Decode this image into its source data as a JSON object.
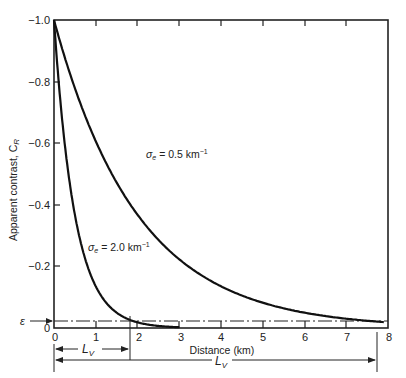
{
  "chart_data": {
    "type": "line",
    "title": "",
    "xlabel": "Distance (km)",
    "ylabel": "Apparent contrast, C_R",
    "xlim": [
      0,
      8
    ],
    "ylim": [
      0,
      -1.0
    ],
    "x_ticks": [
      "0",
      "1",
      "2",
      "3",
      "4",
      "5",
      "6",
      "7",
      "8"
    ],
    "y_ticks": [
      "0",
      "-0.2",
      "-0.4",
      "-0.6",
      "-0.8",
      "-1.0"
    ],
    "grid": false,
    "series": [
      {
        "name": "σe = 0.5 km⁻¹",
        "sigma": 0.5,
        "x": [
          0,
          0.5,
          1,
          1.5,
          2,
          2.5,
          3,
          3.5,
          4,
          4.5,
          5,
          5.5,
          6,
          6.5,
          7,
          7.5,
          7.8,
          8
        ],
        "values": [
          -1.0,
          -0.78,
          -0.61,
          -0.47,
          -0.37,
          -0.29,
          -0.22,
          -0.17,
          -0.14,
          -0.11,
          -0.08,
          -0.06,
          -0.05,
          -0.04,
          -0.03,
          -0.02,
          -0.02,
          -0.02
        ]
      },
      {
        "name": "σe = 2.0 km⁻¹",
        "sigma": 2.0,
        "x": [
          0,
          0.25,
          0.5,
          0.75,
          1,
          1.25,
          1.5,
          1.75,
          1.95,
          2.25,
          2.5,
          2.75,
          3
        ],
        "values": [
          -1.0,
          -0.61,
          -0.37,
          -0.22,
          -0.14,
          -0.08,
          -0.05,
          -0.03,
          -0.02,
          -0.01,
          -0.007,
          -0.004,
          0
        ]
      }
    ],
    "annotations": {
      "epsilon_label": "ε",
      "epsilon_value": -0.02,
      "short_lv_label": "L",
      "short_lv_sub": "V",
      "short_lv_km": 1.85,
      "long_lv_label": "L",
      "long_lv_sub": "V",
      "long_lv_km": 7.8,
      "label_sigma_05": "σe = 0.5 km⁻¹",
      "label_sigma_20": "σe = 2.0 km⁻¹",
      "y_zero_outer": "0"
    }
  },
  "labels": {
    "sigma_symbol": "σ",
    "sigma_sub": "e",
    "label_05_value": " = 0.5 km",
    "label_20_value": " = 2.0 km",
    "exp": "−1",
    "ylabel_text": "Apparent contrast, C",
    "ylabel_sub": "R",
    "xlabel": "Distance (km)",
    "epsilon": "ε",
    "zero_outer": "0",
    "lv_L": "L",
    "lv_V": "V",
    "x_ticks": [
      "0",
      "1",
      "2",
      "3",
      "4",
      "5",
      "6",
      "7",
      "8"
    ],
    "y_ticks": [
      "−1.0",
      "−0.8",
      "−0.6",
      "−0.4",
      "−0.2"
    ]
  }
}
